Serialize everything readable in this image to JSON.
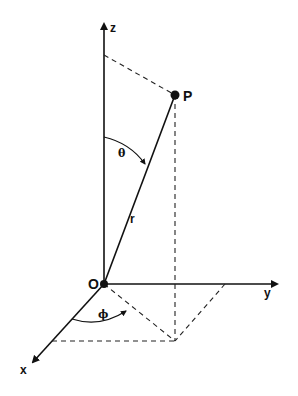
{
  "diagram": {
    "labels": {
      "z_axis": "z",
      "y_axis": "y",
      "x_axis": "x",
      "origin": "O",
      "point": "P",
      "radius": "r",
      "polar_angle": "θ",
      "azimuth_angle": "ϕ"
    },
    "colors": {
      "ink": "#111111",
      "background": "#ffffff"
    }
  }
}
